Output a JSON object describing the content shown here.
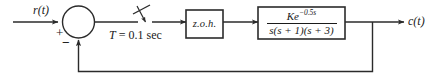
{
  "diagram": {
    "line_color": "#2b2b2b",
    "text_color": "#1a1a1a",
    "background": "#ffffff",
    "signals": {
      "input_label": "r(t)",
      "output_label": "c(t)"
    },
    "summing_junction": {
      "plus_sign": "+",
      "minus_sign": "−"
    },
    "sampler": {
      "period_label_symbol": "T",
      "period_label_rest": " = 0.1 sec",
      "period_label_full": "T = 0.1 sec"
    },
    "blocks": [
      {
        "name": "zero-order-hold",
        "label": "z.o.h."
      },
      {
        "name": "plant-transfer-function",
        "numerator_base": "Ke",
        "numerator_exponent": "−0.5s",
        "denominator": "s(s + 1)(s + 3)",
        "full": "Ke^(-0.5s) / [s(s + 1)(s + 3)]"
      }
    ]
  }
}
